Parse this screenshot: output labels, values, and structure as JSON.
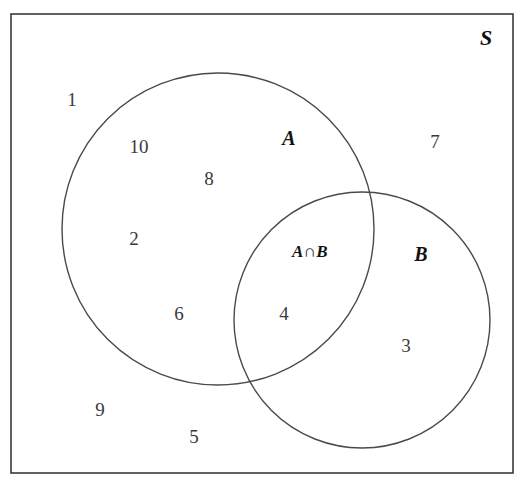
{
  "diagram": {
    "universe_label": "S",
    "set_a_label": "A",
    "set_b_label": "B",
    "intersection_label": "A∩B",
    "line_color": "#3a3a3a",
    "text_color": "#2b2b2b",
    "background_color": "#ffffff",
    "frame": {
      "x": 11,
      "y": 14,
      "width": 502,
      "height": 459,
      "stroke_width": 1.6
    },
    "circle_a": {
      "cx": 218,
      "cy": 229,
      "r": 156,
      "stroke_width": 1.4
    },
    "circle_b": {
      "cx": 362,
      "cy": 320,
      "r": 128,
      "stroke_width": 1.4
    },
    "elements": [
      {
        "value": "1",
        "region": "outside-both",
        "x": 72,
        "y": 99
      },
      {
        "value": "10",
        "region": "a-only",
        "x": 139,
        "y": 146
      },
      {
        "value": "8",
        "region": "a-only",
        "x": 209,
        "y": 178
      },
      {
        "value": "2",
        "region": "a-only",
        "x": 134,
        "y": 238
      },
      {
        "value": "6",
        "region": "a-only",
        "x": 179,
        "y": 313
      },
      {
        "value": "4",
        "region": "intersection",
        "x": 284,
        "y": 313
      },
      {
        "value": "7",
        "region": "outside-both",
        "x": 435,
        "y": 141
      },
      {
        "value": "3",
        "region": "b-only",
        "x": 406,
        "y": 345
      },
      {
        "value": "9",
        "region": "outside-both",
        "x": 100,
        "y": 409
      },
      {
        "value": "5",
        "region": "outside-both",
        "x": 194,
        "y": 436
      }
    ],
    "set_labels": [
      {
        "name": "universe",
        "text": "S",
        "x": 486,
        "y": 38
      },
      {
        "name": "set-a",
        "text": "A",
        "x": 289,
        "y": 138
      },
      {
        "name": "set-b",
        "text": "B",
        "x": 421,
        "y": 254
      },
      {
        "name": "intersection",
        "text": "A∩B",
        "x": 310,
        "y": 251
      }
    ]
  },
  "chart_data": {
    "type": "diagram",
    "subtype": "venn",
    "universe": "S",
    "sets": [
      "A",
      "B"
    ],
    "regions": {
      "a_only": [
        "10",
        "8",
        "2",
        "6"
      ],
      "b_only": [
        "3"
      ],
      "intersection": [
        "4"
      ],
      "outside": [
        "1",
        "7",
        "9",
        "5"
      ]
    },
    "counts": {
      "a_only": 4,
      "b_only": 1,
      "intersection": 1,
      "outside": 4,
      "total": 10
    },
    "all_elements": [
      "1",
      "2",
      "3",
      "4",
      "5",
      "6",
      "7",
      "8",
      "9",
      "10"
    ],
    "annotations": [
      "S",
      "A",
      "B",
      "A∩B"
    ]
  }
}
